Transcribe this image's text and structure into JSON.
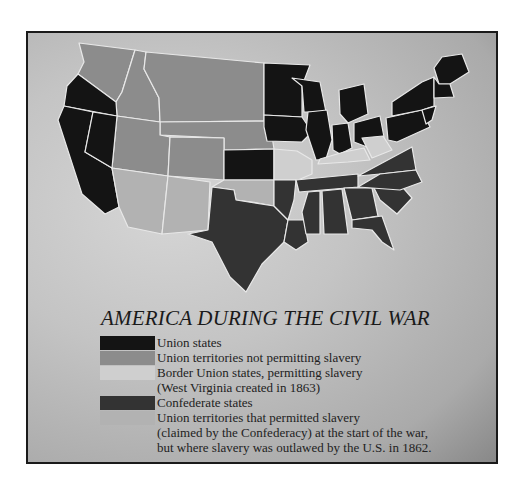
{
  "title": "AMERICA DURING THE CIVIL WAR",
  "colors": {
    "union": "#141414",
    "union_territory_free": "#8c8c8c",
    "border_union": "#cfcfcf",
    "confederate": "#333333",
    "territory_slave": "#b2b2b2",
    "state_border": "#e8e8e8"
  },
  "legend": [
    {
      "label": "Union states",
      "color_key": "union"
    },
    {
      "label": "Union territories not permitting slavery",
      "color_key": "union_territory_free"
    },
    {
      "label": "Border Union states, permitting slavery",
      "color_key": "border_union"
    },
    {
      "label": "(West Virginia created in 1863)",
      "color_key": null
    },
    {
      "label": "Confederate states",
      "color_key": "confederate"
    },
    {
      "label": "Union territories that permitted slavery",
      "color_key": "territory_slave"
    },
    {
      "label": "(claimed by the Confederacy) at the start of the war,",
      "color_key": null
    },
    {
      "label": "but where slavery was outlawed by the U.S. in 1862.",
      "color_key": null
    }
  ]
}
